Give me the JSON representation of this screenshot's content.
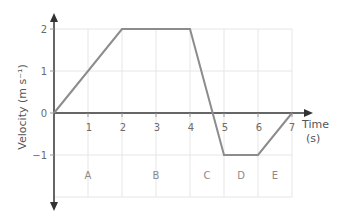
{
  "chart_data": {
    "type": "line",
    "title": "",
    "xlabel": "Time (s)",
    "ylabel": "Velocity (m s⁻¹)",
    "x": [
      0,
      2,
      4,
      5,
      6,
      7
    ],
    "series": [
      {
        "name": "velocity",
        "values": [
          0,
          2,
          2,
          -1,
          -1,
          0
        ]
      }
    ],
    "xlim": [
      0,
      7
    ],
    "ylim": [
      -2,
      2
    ],
    "x_ticks": [
      "1",
      "2",
      "3",
      "4",
      "5",
      "6",
      "7"
    ],
    "y_ticks": [
      "2",
      "1",
      "0",
      "−1"
    ],
    "grid": true,
    "regions": [
      {
        "label": "A",
        "x": 1
      },
      {
        "label": "B",
        "x": 3
      },
      {
        "label": "C",
        "x": 4.5
      },
      {
        "label": "D",
        "x": 5.5
      },
      {
        "label": "E",
        "x": 6.5
      }
    ]
  },
  "axes": {
    "x_title": "Time",
    "x_unit": "(s)",
    "y_title": "Velocity (m s⁻¹)"
  },
  "colors": {
    "line": "#8c8c8c",
    "axis": "#333333",
    "grid": "#e6e6e6"
  }
}
